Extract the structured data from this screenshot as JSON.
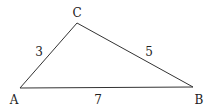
{
  "diagram": {
    "type": "triangle",
    "stroke_color": "#333333",
    "vertices": [
      {
        "id": "A",
        "label": "A",
        "x": 20,
        "y": 88,
        "label_x": 14,
        "label_y": 100
      },
      {
        "id": "B",
        "label": "B",
        "x": 193,
        "y": 87,
        "label_x": 199,
        "label_y": 100
      },
      {
        "id": "C",
        "label": "C",
        "x": 77,
        "y": 23,
        "label_x": 77,
        "label_y": 13
      }
    ],
    "edges": [
      {
        "from": "A",
        "to": "C",
        "label": "3",
        "label_x": 39,
        "label_y": 52
      },
      {
        "from": "C",
        "to": "B",
        "label": "5",
        "label_x": 149,
        "label_y": 52
      },
      {
        "from": "A",
        "to": "B",
        "label": "7",
        "label_x": 98,
        "label_y": 100
      }
    ]
  }
}
